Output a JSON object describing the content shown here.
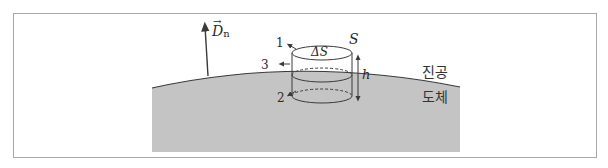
{
  "diagram": {
    "vector_label": {
      "symbol": "D",
      "subscript": "n",
      "has_arrow_over": true
    },
    "surface_labels": {
      "pillbox_surface": "S",
      "top_area": "ΔS",
      "height": "h"
    },
    "face_labels": {
      "top": "1",
      "side": "3",
      "bottom": "2"
    },
    "region_labels": {
      "vacuum": "진공",
      "conductor": "도체"
    },
    "colors": {
      "conductor_fill": "#c4c4c4",
      "line": "#3a3a3a",
      "frame_border": "#a8a8a8",
      "background": "#ffffff"
    }
  }
}
